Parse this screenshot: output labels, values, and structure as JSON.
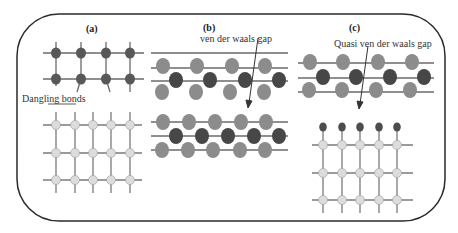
{
  "figure": {
    "panels": [
      {
        "id": "a",
        "label": "(a)",
        "annotation": "Dangling bonds",
        "description": "Two lattices: top with dark-grey atoms and dangling bonds, bottom light-grey square lattice"
      },
      {
        "id": "b",
        "label": "(b)",
        "annotation": "ven der waals gap",
        "description": "Two layered stacks separated by van der Waals gap"
      },
      {
        "id": "c",
        "label": "(c)",
        "annotation": "Quasi ven der waals gap",
        "description": "Layered stack above a passivated square lattice"
      }
    ],
    "colors": {
      "border": "#2a2a2a",
      "dark_atom": "#4a4a4a",
      "mid_atom": "#8a8a8a",
      "light_atom": "#dcdcdc",
      "bond": "#6a6a6a",
      "passivating_atom": "#4d4d4d"
    }
  }
}
